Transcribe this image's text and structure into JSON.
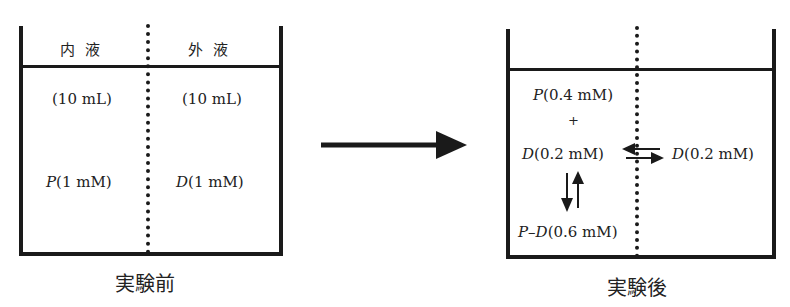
{
  "before": {
    "caption": "実験前",
    "header_inner": "内液",
    "header_outer": "外液",
    "inner_volume": "(10 mL)",
    "outer_volume": "(10 mL)",
    "inner_species": "P",
    "inner_conc": "(1 mM)",
    "outer_species": "D",
    "outer_conc": "(1 mM)"
  },
  "after": {
    "caption": "実験後",
    "inner_p_species": "P",
    "inner_p_conc": "(0.4 mM)",
    "plus": "+",
    "inner_d_species": "D",
    "inner_d_conc": "(0.2 mM)",
    "outer_d_species": "D",
    "outer_d_conc": "(0.2 mM)",
    "complex_species": "P–D",
    "complex_conc": "(0.6 mM)"
  },
  "transition_arrow": "right-arrow"
}
